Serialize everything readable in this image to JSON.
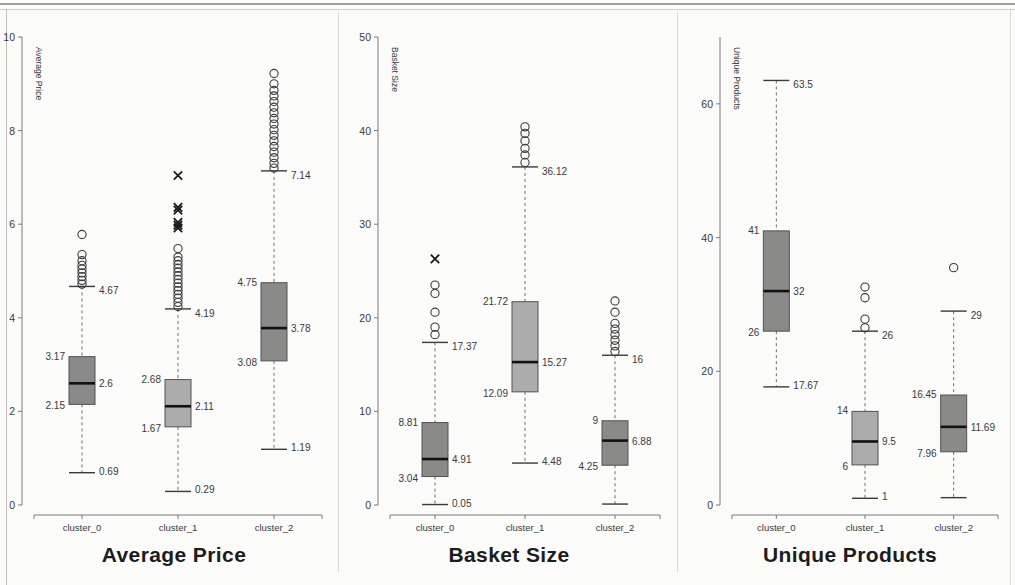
{
  "figure": {
    "background": "#fbfbfa",
    "axis_color": "#7b7b7b",
    "box_fill_dark": "#848484",
    "box_fill_light": "#a8a8a8",
    "median_color": "#111111",
    "label_color": "#3a3a3a"
  },
  "panels": [
    {
      "id": "average-price",
      "title": "Average Price",
      "ylabel": "Average Price",
      "ylim": [
        0,
        10
      ],
      "yticks": [
        0,
        2,
        4,
        6,
        8,
        10
      ],
      "ytick_labels": [
        "0",
        "2",
        "4",
        "6",
        "8",
        "10"
      ],
      "categories": [
        "cluster_0",
        "cluster_1",
        "cluster_2"
      ],
      "boxes": [
        {
          "category": "cluster_0",
          "fill": "#848484",
          "whisker_hi": 4.67,
          "q3": 3.17,
          "median": 2.6,
          "q1": 2.15,
          "whisker_lo": 0.69,
          "labels": {
            "whisker_hi": "4.67",
            "q3": "3.17",
            "median": "2.6",
            "q1": "2.15",
            "whisker_lo": "0.69"
          },
          "outliers_circle": [
            4.72,
            4.8,
            4.88,
            4.96,
            5.04,
            5.12,
            5.22,
            5.35,
            5.78
          ],
          "outliers_x": []
        },
        {
          "category": "cluster_1",
          "fill": "#a8a8a8",
          "whisker_hi": 4.19,
          "q3": 2.68,
          "median": 2.11,
          "q1": 1.67,
          "whisker_lo": 0.29,
          "labels": {
            "whisker_hi": "4.19",
            "q3": "2.68",
            "median": "2.11",
            "q1": "1.67",
            "whisker_lo": "0.29"
          },
          "outliers_circle": [
            4.24,
            4.33,
            4.42,
            4.5,
            4.58,
            4.66,
            4.74,
            4.82,
            4.9,
            4.98,
            5.06,
            5.14,
            5.22,
            5.3,
            5.48
          ],
          "outliers_x": [
            5.92,
            5.98,
            6.04,
            6.3,
            6.36,
            7.04
          ]
        },
        {
          "category": "cluster_2",
          "fill": "#848484",
          "whisker_hi": 7.14,
          "q3": 4.75,
          "median": 3.78,
          "q1": 3.08,
          "whisker_lo": 1.19,
          "labels": {
            "whisker_hi": "7.14",
            "q3": "4.75",
            "median": "3.78",
            "q1": "3.08",
            "whisker_lo": "1.19"
          },
          "outliers_circle": [
            7.2,
            7.3,
            7.42,
            7.54,
            7.66,
            7.78,
            7.9,
            8.02,
            8.14,
            8.26,
            8.38,
            8.5,
            8.62,
            8.74,
            8.86,
            9.0,
            9.22
          ],
          "outliers_x": []
        }
      ]
    },
    {
      "id": "basket-size",
      "title": "Basket Size",
      "ylabel": "Basket Size",
      "ylim": [
        0,
        50
      ],
      "yticks": [
        0,
        10,
        20,
        30,
        40,
        50
      ],
      "ytick_labels": [
        "0",
        "10",
        "20",
        "30",
        "40",
        "50"
      ],
      "categories": [
        "cluster_0",
        "cluster_1",
        "cluster_2"
      ],
      "boxes": [
        {
          "category": "cluster_0",
          "fill": "#848484",
          "whisker_hi": 17.37,
          "q3": 8.81,
          "median": 4.91,
          "q1": 3.04,
          "whisker_lo": 0.05,
          "labels": {
            "whisker_hi": "17.37",
            "q3": "8.81",
            "median": "4.91",
            "q1": "3.04",
            "whisker_lo": "0.05"
          },
          "outliers_circle": [
            18.2,
            19.0,
            20.6,
            22.6,
            23.5
          ],
          "outliers_x": [
            26.3
          ]
        },
        {
          "category": "cluster_1",
          "fill": "#a8a8a8",
          "whisker_hi": 36.12,
          "q3": 21.72,
          "median": 15.27,
          "q1": 12.09,
          "whisker_lo": 4.48,
          "labels": {
            "whisker_hi": "36.12",
            "q3": "21.72",
            "median": "15.27",
            "q1": "12.09",
            "whisker_lo": "4.48"
          },
          "outliers_circle": [
            36.6,
            37.4,
            38.1,
            38.9,
            39.7,
            40.4
          ],
          "outliers_x": []
        },
        {
          "category": "cluster_2",
          "fill": "#848484",
          "whisker_hi": 16.0,
          "q3": 9.0,
          "median": 6.88,
          "q1": 4.25,
          "whisker_lo": 0.1,
          "labels": {
            "whisker_hi": "16",
            "q3": "9",
            "median": "6.88",
            "q1": "4.25",
            "whisker_lo": ""
          },
          "outliers_circle": [
            16.4,
            17.0,
            17.6,
            18.2,
            18.8,
            19.4,
            20.6,
            21.8
          ],
          "outliers_x": []
        }
      ]
    },
    {
      "id": "unique-products",
      "title": "Unique Products",
      "ylabel": "Unique Products",
      "ylim": [
        0,
        70
      ],
      "yticks": [
        0,
        20,
        40,
        60
      ],
      "ytick_labels": [
        "0",
        "20",
        "40",
        "60"
      ],
      "categories": [
        "cluster_0",
        "cluster_1",
        "cluster_2"
      ],
      "boxes": [
        {
          "category": "cluster_0",
          "fill": "#848484",
          "whisker_hi": 63.5,
          "q3": 41.0,
          "median": 32.0,
          "q1": 26.0,
          "whisker_lo": 17.67,
          "labels": {
            "whisker_hi": "63.5",
            "q3": "41",
            "median": "32",
            "q1": "26",
            "whisker_lo": "17.67"
          },
          "outliers_circle": [],
          "outliers_x": []
        },
        {
          "category": "cluster_1",
          "fill": "#a8a8a8",
          "whisker_hi": 26.0,
          "q3": 14.0,
          "median": 9.5,
          "q1": 6.0,
          "whisker_lo": 1.0,
          "labels": {
            "whisker_hi": "26",
            "q3": "14",
            "median": "9.5",
            "q1": "6",
            "whisker_lo": "1"
          },
          "outliers_circle": [
            26.5,
            27.8,
            31.0,
            32.6
          ],
          "outliers_x": []
        },
        {
          "category": "cluster_2",
          "fill": "#848484",
          "whisker_hi": 29.0,
          "q3": 16.45,
          "median": 11.69,
          "q1": 7.96,
          "whisker_lo": 1.1,
          "labels": {
            "whisker_hi": "29",
            "q3": "16.45",
            "median": "11.69",
            "q1": "7.96",
            "whisker_lo": ""
          },
          "outliers_circle": [
            35.5
          ],
          "outliers_x": []
        }
      ]
    }
  ],
  "chart_data": {
    "type": "box",
    "panels": [
      {
        "title": "Average Price",
        "ylabel": "Average Price",
        "xlabel": "",
        "ylim": [
          0,
          10
        ],
        "yticks": [
          0,
          2,
          4,
          6,
          8,
          10
        ],
        "categories": [
          "cluster_0",
          "cluster_1",
          "cluster_2"
        ],
        "series": [
          {
            "name": "cluster_0",
            "whisker_low": 0.69,
            "q1": 2.15,
            "median": 2.6,
            "q3": 3.17,
            "whisker_high": 4.67
          },
          {
            "name": "cluster_1",
            "whisker_low": 0.29,
            "q1": 1.67,
            "median": 2.11,
            "q3": 2.68,
            "whisker_high": 4.19
          },
          {
            "name": "cluster_2",
            "whisker_low": 1.19,
            "q1": 3.08,
            "median": 3.78,
            "q3": 4.75,
            "whisker_high": 7.14
          }
        ]
      },
      {
        "title": "Basket Size",
        "ylabel": "Basket Size",
        "xlabel": "",
        "ylim": [
          0,
          50
        ],
        "yticks": [
          0,
          10,
          20,
          30,
          40,
          50
        ],
        "categories": [
          "cluster_0",
          "cluster_1",
          "cluster_2"
        ],
        "series": [
          {
            "name": "cluster_0",
            "whisker_low": 0.05,
            "q1": 3.04,
            "median": 4.91,
            "q3": 8.81,
            "whisker_high": 17.37
          },
          {
            "name": "cluster_1",
            "whisker_low": 4.48,
            "q1": 12.09,
            "median": 15.27,
            "q3": 21.72,
            "whisker_high": 36.12
          },
          {
            "name": "cluster_2",
            "whisker_low": 0.1,
            "q1": 4.25,
            "median": 6.88,
            "q3": 9.0,
            "whisker_high": 16.0
          }
        ]
      },
      {
        "title": "Unique Products",
        "ylabel": "Unique Products",
        "xlabel": "",
        "ylim": [
          0,
          70
        ],
        "yticks": [
          0,
          20,
          40,
          60
        ],
        "categories": [
          "cluster_0",
          "cluster_1",
          "cluster_2"
        ],
        "series": [
          {
            "name": "cluster_0",
            "whisker_low": 17.67,
            "q1": 26.0,
            "median": 32.0,
            "q3": 41.0,
            "whisker_high": 63.5
          },
          {
            "name": "cluster_1",
            "whisker_low": 1.0,
            "q1": 6.0,
            "median": 9.5,
            "q3": 14.0,
            "whisker_high": 26.0
          },
          {
            "name": "cluster_2",
            "whisker_low": 1.1,
            "q1": 7.96,
            "median": 11.69,
            "q3": 16.45,
            "whisker_high": 29.0
          }
        ]
      }
    ]
  }
}
